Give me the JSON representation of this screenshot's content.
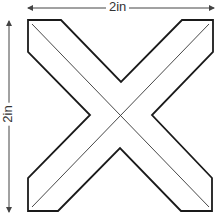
{
  "diagram": {
    "shape": "X-shaped cross outline with center fold lines",
    "width_label": "2in",
    "height_label": "2in",
    "colors": {
      "outline": "#1a1a1a",
      "fold_lines": "#333333",
      "dimension": "#444444",
      "background": "#ffffff"
    }
  }
}
